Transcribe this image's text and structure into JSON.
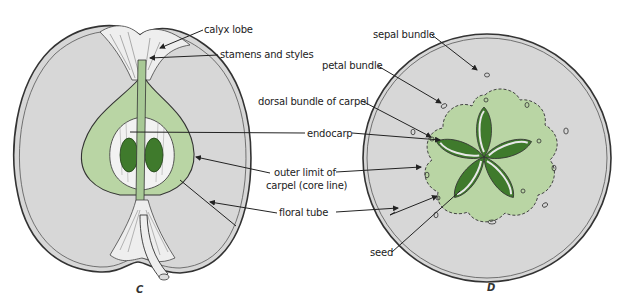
{
  "figure": {
    "panels": [
      {
        "id": "C",
        "letter": "C",
        "description": "Longitudinal section of apple"
      },
      {
        "id": "D",
        "letter": "D",
        "description": "Cross section of apple"
      }
    ],
    "labels": {
      "calyx_lobe": "calyx lobe",
      "stamens_styles": "stamens and styles",
      "sepal_bundle": "sepal bundle",
      "petal_bundle": "petal bundle",
      "dorsal_bundle": "dorsal bundle of carpel",
      "endocarp": "endocarp",
      "outer_limit_line1": "outer limit of",
      "outer_limit_line2": "carpel (core line)",
      "floral_tube": "floral tube",
      "seed": "seed"
    },
    "colors": {
      "flesh": "#d9d9d9",
      "core": "#b5d3a0",
      "seed": "#3f7a2c",
      "outline": "#333333"
    }
  }
}
